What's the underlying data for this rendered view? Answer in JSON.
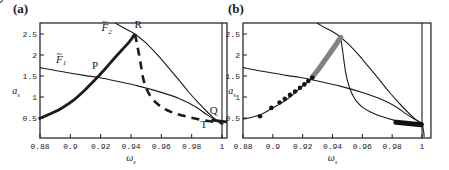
{
  "figure": {
    "background": "#ffffff",
    "ink": "#1c1c1c",
    "gray_marker": "#828282",
    "dot_color": "#151515"
  },
  "chart_data": [
    {
      "type": "line",
      "panel_label": "(a)",
      "xlabel": {
        "base": "ω",
        "sub": "s"
      },
      "ylabel": {
        "base": "a",
        "sub": "s"
      },
      "xlim": [
        0.88,
        1.0033
      ],
      "ylim": [
        0.02,
        2.76
      ],
      "x_ticks": [
        0.88,
        0.9,
        0.92,
        0.94,
        0.96,
        0.98,
        1
      ],
      "x_tick_labels": [
        "0.88",
        "0.9",
        "0.92",
        "0.94",
        "0.96",
        "0.98",
        "1"
      ],
      "y_ticks": [
        0.5,
        1,
        1.5,
        2,
        2.5
      ],
      "y_tick_labels": [
        "0.5",
        "1",
        "1.5",
        "2",
        "2.5"
      ],
      "grid": false,
      "series": [
        {
          "name": "curve-F1",
          "style": "thin",
          "points": [
            [
              0.88,
              1.7
            ],
            [
              0.895,
              1.6
            ],
            [
              0.91,
              1.51
            ],
            [
              0.918,
              1.47
            ],
            [
              0.93,
              1.38
            ],
            [
              0.945,
              1.26
            ],
            [
              0.96,
              1.11
            ],
            [
              0.972,
              0.96
            ],
            [
              0.982,
              0.78
            ],
            [
              0.99,
              0.58
            ],
            [
              0.996,
              0.45
            ],
            [
              1.001,
              0.36
            ]
          ]
        },
        {
          "name": "curve-F2",
          "style": "thin",
          "points": [
            [
              0.9295,
              2.76
            ],
            [
              0.935,
              2.65
            ],
            [
              0.9426,
              2.5
            ],
            [
              0.95,
              2.28
            ],
            [
              0.957,
              2.02
            ],
            [
              0.964,
              1.73
            ],
            [
              0.971,
              1.43
            ],
            [
              0.978,
              1.12
            ],
            [
              0.985,
              0.84
            ],
            [
              0.991,
              0.62
            ],
            [
              0.996,
              0.46
            ],
            [
              1.0,
              0.34
            ]
          ]
        },
        {
          "name": "stable-branch",
          "style": "thick",
          "points": [
            [
              0.879,
              0.48
            ],
            [
              0.887,
              0.6
            ],
            [
              0.895,
              0.75
            ],
            [
              0.903,
              0.95
            ],
            [
              0.91,
              1.18
            ],
            [
              0.916,
              1.4
            ],
            [
              0.922,
              1.63
            ],
            [
              0.928,
              1.88
            ],
            [
              0.934,
              2.12
            ],
            [
              0.939,
              2.32
            ],
            [
              0.9426,
              2.5
            ]
          ]
        },
        {
          "name": "unstable-branch",
          "style": "dashed",
          "points": [
            [
              0.9426,
              2.5
            ],
            [
              0.9442,
              2.22
            ],
            [
              0.9456,
              1.95
            ],
            [
              0.9468,
              1.7
            ],
            [
              0.948,
              1.45
            ],
            [
              0.95,
              1.22
            ],
            [
              0.953,
              1.01
            ],
            [
              0.957,
              0.85
            ],
            [
              0.962,
              0.72
            ],
            [
              0.969,
              0.61
            ],
            [
              0.977,
              0.53
            ],
            [
              0.986,
              0.46
            ],
            [
              0.9945,
              0.41
            ]
          ]
        },
        {
          "name": "omega-1-line",
          "style": "thin",
          "points": [
            [
              1.0,
              0.02
            ],
            [
              1.0,
              2.76
            ]
          ]
        },
        {
          "name": "stable-branch-right-stub",
          "style": "thick",
          "points": [
            [
              0.993,
              0.45
            ],
            [
              1.0033,
              0.41
            ]
          ]
        }
      ],
      "open_markers": [
        {
          "x": 0.996,
          "y": 0.44
        }
      ],
      "annotations": [
        {
          "name": "label-F2",
          "base": "F",
          "tilde": true,
          "sub": "2",
          "italic": true,
          "x": 0.924,
          "y": 2.56
        },
        {
          "name": "label-R",
          "base": "R",
          "tilde": false,
          "sub": "",
          "italic": false,
          "x": 0.9448,
          "y": 2.64
        },
        {
          "name": "label-F1",
          "base": "F",
          "tilde": true,
          "sub": "1",
          "italic": true,
          "x": 0.894,
          "y": 1.82
        },
        {
          "name": "label-P",
          "base": "P",
          "tilde": false,
          "sub": "",
          "italic": false,
          "x": 0.9163,
          "y": 1.67
        },
        {
          "name": "label-Q",
          "base": "Q",
          "tilde": false,
          "sub": "",
          "italic": false,
          "x": 0.9945,
          "y": 0.59
        },
        {
          "name": "label-T",
          "base": "T",
          "tilde": false,
          "sub": "",
          "italic": false,
          "x": 0.988,
          "y": 0.27
        }
      ]
    },
    {
      "type": "line",
      "panel_label": "(b)",
      "xlabel": {
        "base": "ω",
        "sub": "s"
      },
      "ylabel": {
        "base": "a",
        "sub": "s"
      },
      "xlim": [
        0.88,
        1.006
      ],
      "ylim": [
        0.02,
        2.76
      ],
      "x_ticks": [
        0.88,
        0.9,
        0.92,
        0.94,
        0.96,
        0.98,
        1
      ],
      "x_tick_labels": [
        "0.88",
        "0.9",
        "0.92",
        "0.94",
        "0.96",
        "0.98",
        "1"
      ],
      "y_ticks": [
        0.5,
        1,
        1.5,
        2,
        2.5
      ],
      "y_tick_labels": [
        "0.5",
        "1",
        "1.5",
        "2",
        "2.5"
      ],
      "grid": false,
      "series": [
        {
          "name": "curve-F1",
          "style": "thin",
          "points": [
            [
              0.88,
              1.7
            ],
            [
              0.895,
              1.6
            ],
            [
              0.91,
              1.51
            ],
            [
              0.918,
              1.47
            ],
            [
              0.93,
              1.38
            ],
            [
              0.945,
              1.26
            ],
            [
              0.96,
              1.11
            ],
            [
              0.972,
              0.96
            ],
            [
              0.982,
              0.78
            ],
            [
              0.99,
              0.58
            ],
            [
              0.996,
              0.45
            ],
            [
              1.001,
              0.36
            ]
          ]
        },
        {
          "name": "curve-F2",
          "style": "thin",
          "points": [
            [
              0.9295,
              2.76
            ],
            [
              0.935,
              2.65
            ],
            [
              0.9426,
              2.5
            ],
            [
              0.95,
              2.28
            ],
            [
              0.957,
              2.02
            ],
            [
              0.964,
              1.73
            ],
            [
              0.971,
              1.43
            ],
            [
              0.978,
              1.12
            ],
            [
              0.985,
              0.84
            ],
            [
              0.991,
              0.62
            ],
            [
              0.996,
              0.46
            ],
            [
              1.0,
              0.34
            ],
            [
              1.001,
              0.2
            ],
            [
              1.0015,
              0.05
            ]
          ]
        },
        {
          "name": "backbone-branch",
          "style": "thin",
          "points": [
            [
              0.88,
              0.47
            ],
            [
              0.886,
              0.52
            ],
            [
              0.8925,
              0.59
            ],
            [
              0.898,
              0.7
            ],
            [
              0.9026,
              0.79
            ],
            [
              0.9082,
              0.91
            ],
            [
              0.9115,
              1.0
            ],
            [
              0.9149,
              1.1
            ],
            [
              0.9182,
              1.21
            ],
            [
              0.9211,
              1.29
            ],
            [
              0.9238,
              1.37
            ],
            [
              0.9265,
              1.45
            ],
            [
              0.93,
              1.6
            ],
            [
              0.934,
              1.8
            ],
            [
              0.938,
              2.01
            ],
            [
              0.942,
              2.22
            ],
            [
              0.9455,
              2.43
            ]
          ]
        },
        {
          "name": "fold-loop-branch",
          "style": "thin",
          "points": [
            [
              0.9455,
              2.43
            ],
            [
              0.9467,
              2.12
            ],
            [
              0.9478,
              1.83
            ],
            [
              0.949,
              1.55
            ],
            [
              0.9507,
              1.3
            ],
            [
              0.953,
              1.08
            ],
            [
              0.956,
              0.9
            ],
            [
              0.96,
              0.76
            ],
            [
              0.9655,
              0.64
            ],
            [
              0.9725,
              0.54
            ],
            [
              0.981,
              0.45
            ],
            [
              0.99,
              0.39
            ],
            [
              0.9985,
              0.345
            ]
          ]
        },
        {
          "name": "omega-1-line",
          "style": "thin",
          "points": [
            [
              1.0,
              0.02
            ],
            [
              1.0,
              2.76
            ]
          ]
        }
      ],
      "dots": [
        [
          0.8914,
          0.54
        ],
        [
          0.899,
          0.74
        ],
        [
          0.9045,
          0.87
        ],
        [
          0.908,
          0.96
        ],
        [
          0.9115,
          1.05
        ],
        [
          0.9149,
          1.13
        ],
        [
          0.9182,
          1.22
        ],
        [
          0.9211,
          1.3
        ],
        [
          0.9238,
          1.38
        ],
        [
          0.9265,
          1.46
        ]
      ],
      "band": {
        "color": "#828282",
        "width": 5.2,
        "points": [
          [
            0.9265,
            1.48
          ],
          [
            0.93,
            1.63
          ],
          [
            0.934,
            1.83
          ],
          [
            0.938,
            2.03
          ],
          [
            0.942,
            2.23
          ],
          [
            0.9455,
            2.42
          ]
        ]
      },
      "cluster": {
        "color": "#101010",
        "width": 5,
        "points": [
          [
            0.9825,
            0.4
          ],
          [
            0.9995,
            0.34
          ]
        ]
      },
      "annotations": []
    }
  ]
}
